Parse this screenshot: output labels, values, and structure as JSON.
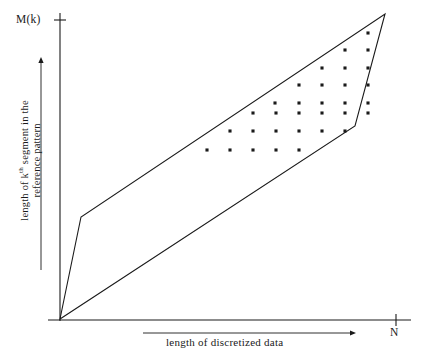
{
  "figure": {
    "background_color": "#ffffff",
    "ink_color": "#1a1a1a",
    "width": 421,
    "height": 360
  },
  "axes": {
    "y_axis": {
      "name": "vertical-axis",
      "x": 60,
      "y_top": 13,
      "y_bottom": 321,
      "tick": {
        "y": 20,
        "half_length": 6
      },
      "top_label": "M(k)",
      "title_line1_prefix": "length of k",
      "title_line1_superscript": "th",
      "title_line1_suffix": " segment in the",
      "title_line2": "reference pattern",
      "arrow": {
        "x": 41,
        "y_tail": 270,
        "y_head": 57
      }
    },
    "x_axis": {
      "name": "horizontal-axis",
      "y": 320,
      "x_left": 48,
      "x_right": 411,
      "tick": {
        "x": 396,
        "half_length": 6
      },
      "end_label": "N",
      "title": "length of discretized data",
      "arrow": {
        "y": 333,
        "x_tail": 143,
        "x_head": 356
      }
    }
  },
  "chart_data": {
    "type": "scatter",
    "title": "",
    "xlabel": "length of discretized data",
    "ylabel": "length of k^th segment in the reference pattern",
    "xlim": [
      0,
      396
    ],
    "ylim": [
      0,
      320
    ],
    "grid": false,
    "legend": null,
    "origin_pixel": [
      60,
      319
    ],
    "warping_band": {
      "name": "admissible-warping-region",
      "description": "closed quadrilateral bounding the allowable warping paths",
      "stroke_color": "#1a1a1a",
      "stroke_width": 1.1,
      "fill": "none",
      "vertices": [
        [
          60,
          319
        ],
        [
          81,
          217
        ],
        [
          385,
          14
        ],
        [
          355,
          126
        ]
      ],
      "vertex_names": [
        "origin-vertex",
        "lower-left-knee",
        "upper-right-apex",
        "lower-right-knee"
      ]
    },
    "points": [
      [
        207,
        150
      ],
      [
        230,
        150
      ],
      [
        253,
        150
      ],
      [
        276,
        150
      ],
      [
        299,
        150
      ],
      [
        230,
        131
      ],
      [
        253,
        131
      ],
      [
        276,
        131
      ],
      [
        299,
        131
      ],
      [
        322,
        131
      ],
      [
        345,
        131
      ],
      [
        253,
        113
      ],
      [
        276,
        113
      ],
      [
        299,
        113
      ],
      [
        322,
        113
      ],
      [
        345,
        113
      ],
      [
        368,
        113
      ],
      [
        275,
        103
      ],
      [
        299,
        103
      ],
      [
        322,
        103
      ],
      [
        345,
        103
      ],
      [
        368,
        103
      ],
      [
        299,
        85
      ],
      [
        322,
        85
      ],
      [
        345,
        85
      ],
      [
        368,
        85
      ],
      [
        322,
        68
      ],
      [
        345,
        68
      ],
      [
        368,
        68
      ],
      [
        345,
        50
      ],
      [
        368,
        50
      ],
      [
        368,
        33
      ]
    ],
    "point_style": {
      "marker": "square-dot",
      "size": 3.1,
      "color": "#1a1a1a"
    },
    "point_count": 32,
    "rows": [
      {
        "y": 150,
        "count": 5
      },
      {
        "y": 131,
        "count": 6
      },
      {
        "y": 113,
        "count": 6
      },
      {
        "y": 103,
        "count": 5
      },
      {
        "y": 85,
        "count": 4
      },
      {
        "y": 68,
        "count": 3
      },
      {
        "y": 50,
        "count": 2
      },
      {
        "y": 33,
        "count": 1
      }
    ]
  }
}
